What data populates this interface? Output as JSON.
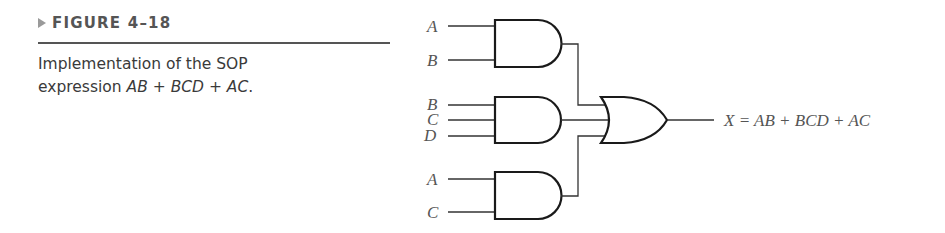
{
  "figure": {
    "label": "FIGURE 4–18",
    "caption_prefix": "Implementation of the SOP",
    "caption_line2_prefix": "expression ",
    "caption_expression": "AB + BCD + AC",
    "caption_suffix": "."
  },
  "diagram": {
    "gates": [
      {
        "type": "AND",
        "inputs": [
          "A",
          "B"
        ],
        "output_term": "AB"
      },
      {
        "type": "AND",
        "inputs": [
          "B",
          "C",
          "D"
        ],
        "output_term": "BCD"
      },
      {
        "type": "AND",
        "inputs": [
          "A",
          "C"
        ],
        "output_term": "AC"
      },
      {
        "type": "OR",
        "inputs": [
          "AB",
          "BCD",
          "AC"
        ],
        "output": "X"
      }
    ],
    "input_labels": {
      "g1_a": "A",
      "g1_b": "B",
      "g2_b": "B",
      "g2_c": "C",
      "g2_d": "D",
      "g3_a": "A",
      "g3_c": "C"
    },
    "output_label": "X = AB + BCD + AC"
  },
  "colors": {
    "text": "#3a3a3a",
    "header": "#555555",
    "arrow": "#9a9a9a",
    "wire": "#333333",
    "gate": "#1a1a1a"
  }
}
